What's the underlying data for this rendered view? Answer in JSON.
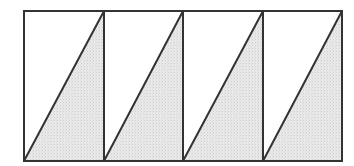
{
  "diagram": {
    "outer_rect": {
      "x1": 24,
      "y1": 11,
      "x2": 342,
      "y2": 161
    },
    "cell_count": 4,
    "cells": [
      {
        "index": 1,
        "x1": 24,
        "x2": 104,
        "shaded": "lower-right-triangle"
      },
      {
        "index": 2,
        "x1": 104,
        "x2": 183,
        "shaded": "lower-right-triangle"
      },
      {
        "index": 3,
        "x1": 183,
        "x2": 263,
        "shaded": "lower-right-triangle"
      },
      {
        "index": 4,
        "x1": 263,
        "x2": 342,
        "shaded": "lower-right-triangle"
      }
    ],
    "colors": {
      "line": "#333333",
      "shade": "#e9e9e9",
      "shade_dot": "#cfcfcf",
      "background": "#ffffff"
    },
    "line_width": 2
  }
}
